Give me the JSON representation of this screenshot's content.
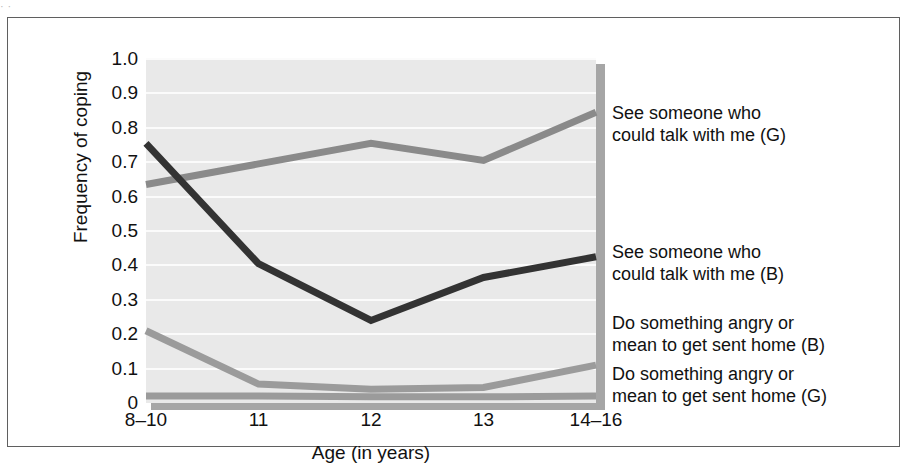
{
  "figure": {
    "top_fragment": "·                              ·",
    "frame_border_color": "#5f5f5f",
    "plot_background_color": "#e9e9e9",
    "gridline_color": "#fbfbfb"
  },
  "chart_data": {
    "type": "line",
    "title": "",
    "xlabel": "Age (in years)",
    "ylabel": "Frequency of coping",
    "categories": [
      "8–10",
      "11",
      "12",
      "13",
      "14–16"
    ],
    "x_tick_labels": [
      "8–10",
      "11",
      "12",
      "13",
      "14–16"
    ],
    "y_tick_labels": [
      "1.0",
      "0.9",
      "0.8",
      "0.7",
      "0.6",
      "0.5",
      "0.4",
      "0.3",
      "0.2",
      "0.1",
      "0"
    ],
    "y_tick_values": [
      1.0,
      0.9,
      0.8,
      0.7,
      0.6,
      0.5,
      0.4,
      0.3,
      0.2,
      0.1,
      0
    ],
    "ylim": [
      0,
      1.0
    ],
    "grid": true,
    "legend_position": "right",
    "series": [
      {
        "name": "See someone who could talk with me (G)",
        "label_line1": "See someone who",
        "label_line2": "could talk with me (G)",
        "color": "#8a8a8a",
        "values": [
          0.635,
          0.695,
          0.755,
          0.705,
          0.845
        ]
      },
      {
        "name": "See someone who could talk with me (B)",
        "label_line1": "See someone who",
        "label_line2": "could talk with me (B)",
        "color": "#333333",
        "values": [
          0.755,
          0.405,
          0.24,
          0.365,
          0.425
        ]
      },
      {
        "name": "Do something angry or mean to get sent home (B)",
        "label_line1": "Do something angry or",
        "label_line2": "mean to get sent home (B)",
        "color": "#9b9b9b",
        "values": [
          0.21,
          0.055,
          0.04,
          0.045,
          0.11
        ]
      },
      {
        "name": "Do something angry or mean to get sent home (G)",
        "label_line1": "Do something angry or",
        "label_line2": "mean to get sent home (G)",
        "color": "#9b9b9b",
        "values": [
          0.02,
          0.02,
          0.018,
          0.018,
          0.02
        ]
      }
    ]
  },
  "legend": [
    {
      "line1": "See someone who",
      "line2": "could talk with me (G)",
      "top": 84
    },
    {
      "line1": "See someone who",
      "line2": "could talk with me (B)",
      "top": 223
    },
    {
      "line1": "Do something angry or",
      "line2": "mean to get sent home (B)",
      "top": 294
    },
    {
      "line1": "Do something angry or",
      "line2": "mean to get sent home (G)",
      "top": 345
    }
  ]
}
